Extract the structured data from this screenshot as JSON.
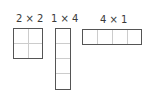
{
  "diagram": {
    "grids": [
      {
        "label": "2 × 2",
        "cols": 2,
        "rows": 2
      },
      {
        "label": "1 × 4",
        "cols": 1,
        "rows": 4
      },
      {
        "label": "4 × 1",
        "cols": 4,
        "rows": 1
      }
    ],
    "colors": {
      "outline": "#555555",
      "divider": "#bbbbbb",
      "text": "#3a3a3a"
    }
  }
}
